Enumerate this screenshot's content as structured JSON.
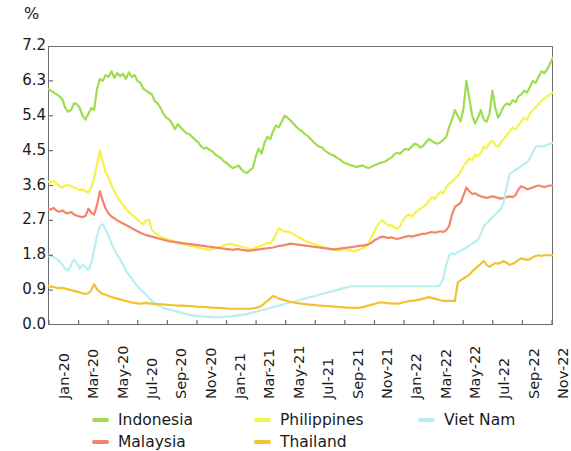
{
  "chart_data": {
    "type": "line",
    "title": "",
    "subtitle": "",
    "xlabel": "",
    "ylabel": "%",
    "unit_label": "%",
    "ylim": [
      0.0,
      7.2
    ],
    "yticks": [
      "0.0",
      "0.9",
      "1.8",
      "2.7",
      "3.6",
      "4.5",
      "5.4",
      "6.3",
      "7.2"
    ],
    "ytick_values": [
      0.0,
      0.9,
      1.8,
      2.7,
      3.6,
      4.5,
      5.4,
      6.3,
      7.2
    ],
    "grid": false,
    "legend_position": "bottom",
    "x_tick_labels": [
      "Jan-20",
      "Mar-20",
      "May-20",
      "Jul-20",
      "Sep-20",
      "Nov-20",
      "Jan-21",
      "Mar-21",
      "May-21",
      "Jul-21",
      "Sep-21",
      "Nov-21",
      "Jan-22",
      "Mar-22",
      "May-22",
      "Jul-22",
      "Sep-22",
      "Nov-22"
    ],
    "x_range": [
      "Jan-20",
      "Nov-22"
    ],
    "x_note": "Weekly observations spanning Jan-2020 through Nov-2022; axis labelled every 2 months",
    "colors": {
      "Indonesia": "#9fdd4e",
      "Malaysia": "#f2856b",
      "Philippines": "#f7f24a",
      "Thailand": "#f2c230",
      "Viet Nam": "#b9eff0"
    },
    "series": [
      {
        "name": "Indonesia",
        "color": "#9fdd4e",
        "values": [
          6.1,
          6.05,
          6.0,
          5.95,
          5.9,
          5.82,
          5.6,
          5.5,
          5.55,
          5.72,
          5.7,
          5.6,
          5.4,
          5.3,
          5.45,
          5.6,
          5.55,
          6.1,
          6.35,
          6.3,
          6.45,
          6.4,
          6.55,
          6.38,
          6.5,
          6.42,
          6.48,
          6.35,
          6.52,
          6.4,
          6.45,
          6.3,
          6.25,
          6.1,
          6.05,
          6.0,
          5.95,
          5.78,
          5.72,
          5.6,
          5.45,
          5.35,
          5.3,
          5.2,
          5.05,
          5.18,
          5.1,
          5.02,
          4.95,
          4.92,
          4.85,
          4.78,
          4.72,
          4.62,
          4.55,
          4.58,
          4.52,
          4.48,
          4.4,
          4.35,
          4.3,
          4.22,
          4.18,
          4.1,
          4.05,
          4.08,
          4.12,
          4.02,
          3.95,
          3.92,
          4.0,
          4.05,
          4.35,
          4.55,
          4.42,
          4.7,
          4.85,
          4.8,
          5.0,
          5.15,
          5.1,
          5.25,
          5.4,
          5.35,
          5.28,
          5.2,
          5.12,
          5.05,
          5.0,
          4.92,
          4.88,
          4.8,
          4.72,
          4.65,
          4.6,
          4.58,
          4.5,
          4.45,
          4.4,
          4.38,
          4.32,
          4.28,
          4.22,
          4.18,
          4.15,
          4.12,
          4.1,
          4.08,
          4.1,
          4.12,
          4.08,
          4.05,
          4.08,
          4.12,
          4.15,
          4.18,
          4.2,
          4.22,
          4.28,
          4.32,
          4.4,
          4.45,
          4.42,
          4.5,
          4.55,
          4.52,
          4.6,
          4.68,
          4.65,
          4.58,
          4.62,
          4.72,
          4.8,
          4.75,
          4.7,
          4.68,
          4.72,
          4.78,
          4.85,
          5.1,
          5.3,
          5.55,
          5.4,
          5.25,
          5.6,
          6.3,
          5.85,
          5.4,
          5.2,
          5.35,
          5.55,
          5.3,
          5.25,
          5.45,
          6.05,
          5.6,
          5.35,
          5.5,
          5.65,
          5.72,
          5.68,
          5.8,
          5.75,
          5.9,
          5.95,
          6.05,
          6.0,
          6.15,
          6.3,
          6.25,
          6.4,
          6.55,
          6.5,
          6.6,
          6.75,
          6.9
        ]
      },
      {
        "name": "Philippines",
        "color": "#f7f24a",
        "values": [
          3.7,
          3.68,
          3.72,
          3.65,
          3.58,
          3.55,
          3.6,
          3.62,
          3.58,
          3.55,
          3.52,
          3.48,
          3.5,
          3.46,
          3.42,
          3.55,
          3.8,
          4.15,
          4.5,
          4.2,
          3.95,
          3.8,
          3.6,
          3.45,
          3.3,
          3.2,
          3.1,
          3.0,
          2.92,
          2.85,
          2.78,
          2.72,
          2.65,
          2.6,
          2.7,
          2.72,
          2.45,
          2.38,
          2.32,
          2.28,
          2.25,
          2.22,
          2.2,
          2.18,
          2.15,
          2.12,
          2.1,
          2.08,
          2.06,
          2.05,
          2.04,
          2.02,
          2.0,
          1.98,
          1.96,
          1.95,
          1.94,
          1.96,
          1.98,
          2.0,
          2.02,
          2.05,
          2.08,
          2.1,
          2.08,
          2.06,
          2.04,
          2.02,
          2.0,
          1.98,
          1.96,
          1.95,
          2.0,
          2.02,
          2.05,
          2.08,
          2.12,
          2.1,
          2.2,
          2.35,
          2.5,
          2.45,
          2.4,
          2.42,
          2.38,
          2.35,
          2.3,
          2.26,
          2.22,
          2.18,
          2.15,
          2.12,
          2.1,
          2.06,
          2.04,
          2.02,
          2.0,
          1.98,
          1.96,
          1.95,
          1.94,
          1.92,
          1.95,
          1.96,
          1.94,
          1.92,
          1.9,
          1.92,
          1.95,
          1.98,
          2.02,
          2.1,
          2.25,
          2.4,
          2.55,
          2.65,
          2.7,
          2.62,
          2.56,
          2.58,
          2.52,
          2.48,
          2.55,
          2.7,
          2.8,
          2.85,
          2.8,
          2.88,
          2.95,
          3.0,
          3.05,
          3.1,
          3.2,
          3.3,
          3.25,
          3.35,
          3.45,
          3.4,
          3.55,
          3.65,
          3.7,
          3.78,
          3.85,
          3.95,
          4.1,
          4.2,
          4.3,
          4.25,
          4.4,
          4.35,
          4.45,
          4.6,
          4.55,
          4.7,
          4.75,
          4.65,
          4.6,
          4.72,
          4.8,
          4.9,
          5.0,
          5.1,
          5.05,
          5.15,
          5.25,
          5.35,
          5.3,
          5.45,
          5.55,
          5.62,
          5.7,
          5.78,
          5.85,
          5.9,
          5.95,
          6.0
        ]
      },
      {
        "name": "Malaysia",
        "color": "#f2856b",
        "values": [
          3.0,
          2.98,
          3.02,
          2.95,
          2.92,
          2.96,
          2.9,
          2.88,
          2.92,
          2.85,
          2.82,
          2.8,
          2.78,
          2.82,
          3.0,
          2.9,
          2.85,
          3.1,
          3.45,
          3.2,
          3.0,
          2.88,
          2.8,
          2.75,
          2.7,
          2.66,
          2.62,
          2.58,
          2.54,
          2.5,
          2.46,
          2.42,
          2.38,
          2.35,
          2.32,
          2.3,
          2.28,
          2.26,
          2.24,
          2.22,
          2.2,
          2.18,
          2.16,
          2.15,
          2.14,
          2.13,
          2.12,
          2.11,
          2.1,
          2.09,
          2.08,
          2.07,
          2.06,
          2.05,
          2.04,
          2.03,
          2.02,
          2.01,
          2.0,
          1.99,
          1.98,
          1.97,
          1.96,
          1.95,
          1.94,
          1.95,
          1.96,
          1.94,
          1.93,
          1.92,
          1.92,
          1.93,
          1.94,
          1.95,
          1.96,
          1.97,
          1.98,
          1.99,
          2.0,
          2.02,
          2.04,
          2.05,
          2.06,
          2.08,
          2.1,
          2.09,
          2.08,
          2.07,
          2.06,
          2.05,
          2.04,
          2.03,
          2.02,
          2.01,
          2.0,
          1.99,
          1.98,
          1.97,
          1.96,
          1.95,
          1.96,
          1.97,
          1.98,
          1.99,
          2.0,
          2.01,
          2.02,
          2.03,
          2.04,
          2.05,
          2.06,
          2.08,
          2.12,
          2.18,
          2.22,
          2.26,
          2.28,
          2.26,
          2.25,
          2.26,
          2.24,
          2.22,
          2.24,
          2.26,
          2.28,
          2.3,
          2.28,
          2.3,
          2.32,
          2.34,
          2.35,
          2.36,
          2.38,
          2.4,
          2.38,
          2.4,
          2.42,
          2.4,
          2.45,
          2.55,
          2.85,
          3.05,
          3.1,
          3.15,
          3.35,
          3.55,
          3.45,
          3.38,
          3.4,
          3.35,
          3.32,
          3.3,
          3.28,
          3.3,
          3.32,
          3.3,
          3.28,
          3.26,
          3.28,
          3.3,
          3.32,
          3.3,
          3.35,
          3.5,
          3.58,
          3.55,
          3.5,
          3.52,
          3.55,
          3.58,
          3.6,
          3.58,
          3.56,
          3.58,
          3.6,
          3.6
        ]
      },
      {
        "name": "Viet Nam",
        "color": "#b9eff0",
        "values": [
          1.8,
          1.78,
          1.75,
          1.7,
          1.65,
          1.55,
          1.45,
          1.4,
          1.55,
          1.7,
          1.6,
          1.45,
          1.55,
          1.5,
          1.42,
          1.6,
          1.95,
          2.3,
          2.55,
          2.6,
          2.45,
          2.3,
          2.1,
          1.95,
          1.8,
          1.7,
          1.55,
          1.4,
          1.3,
          1.2,
          1.1,
          1.0,
          0.92,
          0.85,
          0.78,
          0.7,
          0.62,
          0.58,
          0.52,
          0.48,
          0.44,
          0.42,
          0.4,
          0.38,
          0.36,
          0.34,
          0.32,
          0.3,
          0.28,
          0.26,
          0.25,
          0.24,
          0.23,
          0.22,
          0.22,
          0.21,
          0.21,
          0.2,
          0.2,
          0.2,
          0.2,
          0.21,
          0.22,
          0.22,
          0.23,
          0.24,
          0.25,
          0.26,
          0.27,
          0.28,
          0.3,
          0.32,
          0.34,
          0.36,
          0.38,
          0.4,
          0.42,
          0.44,
          0.46,
          0.48,
          0.5,
          0.52,
          0.54,
          0.56,
          0.58,
          0.6,
          0.62,
          0.64,
          0.66,
          0.68,
          0.7,
          0.72,
          0.74,
          0.76,
          0.78,
          0.8,
          0.82,
          0.84,
          0.86,
          0.88,
          0.9,
          0.92,
          0.94,
          0.96,
          0.98,
          1.0,
          1.0,
          1.0,
          1.0,
          1.0,
          1.0,
          1.0,
          1.0,
          1.0,
          1.0,
          1.0,
          1.0,
          1.0,
          1.0,
          1.0,
          1.0,
          1.0,
          1.0,
          1.0,
          1.0,
          1.0,
          1.0,
          1.0,
          1.0,
          1.0,
          1.0,
          1.0,
          1.0,
          1.0,
          1.0,
          1.0,
          1.05,
          1.2,
          1.55,
          1.8,
          1.85,
          1.82,
          1.88,
          1.92,
          1.95,
          2.0,
          2.05,
          2.1,
          2.15,
          2.2,
          2.35,
          2.55,
          2.62,
          2.7,
          2.78,
          2.85,
          2.92,
          3.0,
          3.2,
          3.6,
          3.9,
          3.95,
          4.0,
          4.05,
          4.1,
          4.15,
          4.2,
          4.3,
          4.45,
          4.6,
          4.62,
          4.6,
          4.62,
          4.65,
          4.68,
          4.7
        ]
      },
      {
        "name": "Thailand",
        "color": "#f2c230",
        "values": [
          1.0,
          0.99,
          0.98,
          0.96,
          0.95,
          0.96,
          0.94,
          0.92,
          0.9,
          0.88,
          0.86,
          0.84,
          0.82,
          0.8,
          0.82,
          0.9,
          1.05,
          0.92,
          0.85,
          0.8,
          0.78,
          0.75,
          0.72,
          0.7,
          0.68,
          0.66,
          0.64,
          0.62,
          0.6,
          0.58,
          0.57,
          0.56,
          0.55,
          0.56,
          0.57,
          0.56,
          0.55,
          0.54,
          0.54,
          0.53,
          0.53,
          0.52,
          0.52,
          0.51,
          0.51,
          0.5,
          0.5,
          0.5,
          0.49,
          0.49,
          0.48,
          0.48,
          0.47,
          0.47,
          0.46,
          0.46,
          0.45,
          0.45,
          0.44,
          0.44,
          0.44,
          0.43,
          0.43,
          0.42,
          0.42,
          0.42,
          0.42,
          0.42,
          0.42,
          0.42,
          0.42,
          0.43,
          0.44,
          0.46,
          0.5,
          0.56,
          0.62,
          0.68,
          0.75,
          0.72,
          0.68,
          0.66,
          0.64,
          0.62,
          0.6,
          0.58,
          0.57,
          0.56,
          0.55,
          0.54,
          0.53,
          0.52,
          0.52,
          0.51,
          0.5,
          0.5,
          0.49,
          0.49,
          0.48,
          0.48,
          0.47,
          0.46,
          0.46,
          0.45,
          0.45,
          0.44,
          0.44,
          0.44,
          0.45,
          0.46,
          0.48,
          0.5,
          0.52,
          0.54,
          0.56,
          0.58,
          0.58,
          0.57,
          0.56,
          0.56,
          0.55,
          0.55,
          0.56,
          0.58,
          0.6,
          0.62,
          0.62,
          0.63,
          0.64,
          0.66,
          0.68,
          0.7,
          0.72,
          0.7,
          0.68,
          0.66,
          0.64,
          0.62,
          0.62,
          0.62,
          0.62,
          0.62,
          1.1,
          1.15,
          1.2,
          1.25,
          1.3,
          1.38,
          1.45,
          1.52,
          1.58,
          1.65,
          1.55,
          1.5,
          1.55,
          1.6,
          1.58,
          1.62,
          1.65,
          1.6,
          1.55,
          1.58,
          1.62,
          1.68,
          1.72,
          1.7,
          1.68,
          1.7,
          1.75,
          1.78,
          1.8,
          1.78,
          1.8,
          1.8,
          1.8,
          1.8
        ]
      }
    ]
  },
  "legend": {
    "items": [
      {
        "label": "Indonesia",
        "color": "#9fdd4e",
        "col": 0,
        "row": 0
      },
      {
        "label": "Malaysia",
        "color": "#f2856b",
        "col": 0,
        "row": 1
      },
      {
        "label": "Philippines",
        "color": "#f7f24a",
        "col": 1,
        "row": 0
      },
      {
        "label": "Thailand",
        "color": "#f2c230",
        "col": 1,
        "row": 1
      },
      {
        "label": "Viet Nam",
        "color": "#b9eff0",
        "col": 2,
        "row": 0
      }
    ]
  }
}
